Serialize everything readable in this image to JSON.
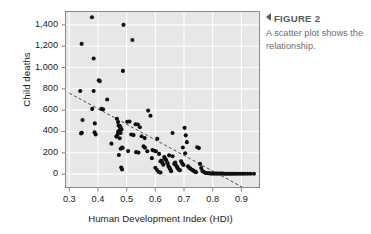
{
  "caption": {
    "arrow_icon": "triangle-left-icon",
    "heading": "FIGURE 2",
    "body": "A scatter plot shows the relationship."
  },
  "colors": {
    "plot_background": "#e7e7e7",
    "gridline": "#ffffff",
    "frame": "#8a8a8a",
    "point": "#101010",
    "trendline": "#4a4a4a",
    "caption_heading": "#595959",
    "caption_body": "#6e6e6e",
    "axis_text": "#1a1a1a"
  },
  "chart_data": {
    "type": "scatter",
    "title": "",
    "xlabel": "Human Development Index (HDI)",
    "ylabel": "Child deaths",
    "xlim": [
      0.285,
      0.965
    ],
    "ylim": [
      -130,
      1530
    ],
    "xticks": [
      0.3,
      0.4,
      0.5,
      0.6,
      0.7,
      0.8,
      0.9
    ],
    "xticklabels": [
      "0.3",
      "0.4",
      "0.5",
      "0.6",
      "0.7",
      "0.8",
      "0.9"
    ],
    "yticks": [
      0,
      200,
      400,
      600,
      800,
      1000,
      1200,
      1400
    ],
    "yticklabels": [
      "0",
      "200",
      "400",
      "600",
      "800",
      "1,000",
      "1,200",
      "1,400"
    ],
    "grid": true,
    "legend": false,
    "marker": "filled-circle",
    "trendline": {
      "style": "dashed",
      "x": [
        0.3,
        0.95
      ],
      "y": [
        760,
        -190
      ]
    },
    "points": [
      [
        0.343,
        1222
      ],
      [
        0.379,
        1472
      ],
      [
        0.385,
        1085
      ],
      [
        0.403,
        880
      ],
      [
        0.406,
        872
      ],
      [
        0.412,
        612
      ],
      [
        0.489,
        1400
      ],
      [
        0.52,
        1258
      ],
      [
        0.487,
        968
      ],
      [
        0.338,
        780
      ],
      [
        0.385,
        780
      ],
      [
        0.346,
        508
      ],
      [
        0.38,
        612
      ],
      [
        0.418,
        608
      ],
      [
        0.432,
        700
      ],
      [
        0.389,
        476
      ],
      [
        0.388,
        392
      ],
      [
        0.392,
        372
      ],
      [
        0.344,
        388
      ],
      [
        0.341,
        382
      ],
      [
        0.447,
        286
      ],
      [
        0.466,
        520
      ],
      [
        0.47,
        488
      ],
      [
        0.472,
        455
      ],
      [
        0.476,
        452
      ],
      [
        0.478,
        440
      ],
      [
        0.48,
        430
      ],
      [
        0.482,
        418
      ],
      [
        0.474,
        408
      ],
      [
        0.47,
        398
      ],
      [
        0.479,
        386
      ],
      [
        0.468,
        368
      ],
      [
        0.464,
        352
      ],
      [
        0.476,
        336
      ],
      [
        0.484,
        250
      ],
      [
        0.486,
        246
      ],
      [
        0.479,
        238
      ],
      [
        0.473,
        180
      ],
      [
        0.481,
        62
      ],
      [
        0.484,
        44
      ],
      [
        0.502,
        492
      ],
      [
        0.51,
        494
      ],
      [
        0.516,
        372
      ],
      [
        0.524,
        366
      ],
      [
        0.531,
        468
      ],
      [
        0.539,
        466
      ],
      [
        0.546,
        440
      ],
      [
        0.552,
        356
      ],
      [
        0.533,
        206
      ],
      [
        0.541,
        202
      ],
      [
        0.505,
        216
      ],
      [
        0.559,
        260
      ],
      [
        0.564,
        248
      ],
      [
        0.575,
        596
      ],
      [
        0.583,
        548
      ],
      [
        0.59,
        226
      ],
      [
        0.596,
        220
      ],
      [
        0.602,
        214
      ],
      [
        0.563,
        338
      ],
      [
        0.607,
        332
      ],
      [
        0.613,
        190
      ],
      [
        0.618,
        120
      ],
      [
        0.622,
        128
      ],
      [
        0.625,
        104
      ],
      [
        0.628,
        88
      ],
      [
        0.631,
        160
      ],
      [
        0.634,
        146
      ],
      [
        0.637,
        134
      ],
      [
        0.64,
        116
      ],
      [
        0.643,
        100
      ],
      [
        0.646,
        74
      ],
      [
        0.649,
        60
      ],
      [
        0.652,
        46
      ],
      [
        0.655,
        28
      ],
      [
        0.612,
        20
      ],
      [
        0.618,
        16
      ],
      [
        0.66,
        386
      ],
      [
        0.666,
        96
      ],
      [
        0.669,
        108
      ],
      [
        0.672,
        84
      ],
      [
        0.675,
        70
      ],
      [
        0.678,
        56
      ],
      [
        0.682,
        42
      ],
      [
        0.686,
        36
      ],
      [
        0.69,
        120
      ],
      [
        0.694,
        100
      ],
      [
        0.698,
        86
      ],
      [
        0.702,
        434
      ],
      [
        0.706,
        364
      ],
      [
        0.71,
        300
      ],
      [
        0.714,
        74
      ],
      [
        0.718,
        60
      ],
      [
        0.722,
        52
      ],
      [
        0.726,
        44
      ],
      [
        0.73,
        38
      ],
      [
        0.734,
        30
      ],
      [
        0.738,
        24
      ],
      [
        0.742,
        18
      ],
      [
        0.746,
        252
      ],
      [
        0.752,
        244
      ],
      [
        0.756,
        96
      ],
      [
        0.76,
        58
      ],
      [
        0.764,
        30
      ],
      [
        0.768,
        22
      ],
      [
        0.772,
        16
      ],
      [
        0.776,
        12
      ],
      [
        0.78,
        10
      ],
      [
        0.784,
        8
      ],
      [
        0.788,
        8
      ],
      [
        0.792,
        6
      ],
      [
        0.796,
        6
      ],
      [
        0.8,
        6
      ],
      [
        0.806,
        5
      ],
      [
        0.812,
        5
      ],
      [
        0.818,
        5
      ],
      [
        0.824,
        5
      ],
      [
        0.83,
        5
      ],
      [
        0.836,
        5
      ],
      [
        0.842,
        4
      ],
      [
        0.848,
        4
      ],
      [
        0.854,
        4
      ],
      [
        0.86,
        4
      ],
      [
        0.866,
        4
      ],
      [
        0.872,
        4
      ],
      [
        0.88,
        4
      ],
      [
        0.888,
        4
      ],
      [
        0.896,
        4
      ],
      [
        0.904,
        4
      ],
      [
        0.912,
        4
      ],
      [
        0.922,
        4
      ],
      [
        0.932,
        4
      ],
      [
        0.944,
        4
      ],
      [
        0.648,
        176
      ],
      [
        0.66,
        168
      ],
      [
        0.696,
        250
      ],
      [
        0.704,
        196
      ],
      [
        0.588,
        150
      ],
      [
        0.6,
        60
      ],
      [
        0.606,
        38
      ],
      [
        0.572,
        214
      ]
    ]
  }
}
